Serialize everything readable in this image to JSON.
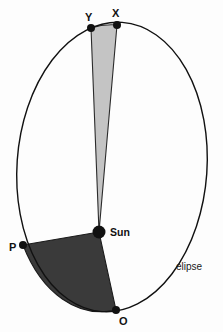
{
  "figure": {
    "background_color": "#fdfdfd",
    "stroke_color": "#111111"
  },
  "labels": {
    "point_y": "Y",
    "point_x": "X",
    "point_p": "P",
    "point_o": "O",
    "sun": "Sun",
    "ellipse": "elipse"
  },
  "chart_data": {
    "type": "diagram",
    "title": "",
    "background_color": "#fdfdfd",
    "orbit": {
      "shape": "ellipse",
      "stroke_color": "#111111",
      "stroke_width": 1.4,
      "fill": "none",
      "center": [
        112,
        167
      ],
      "semi_major_axis": 145,
      "semi_minor_axis": 95,
      "rotation_deg": 4
    },
    "points": [
      {
        "name": "Y",
        "label": "Y",
        "x": 91,
        "y": 28,
        "marker": "filled-circle",
        "radius": 4.0,
        "color": "#111111",
        "label_dx": -6,
        "label_dy": -16
      },
      {
        "name": "X",
        "label": "X",
        "x": 117,
        "y": 25,
        "marker": "filled-circle",
        "radius": 4.0,
        "color": "#111111",
        "label_dx": -5,
        "label_dy": -17
      },
      {
        "name": "P",
        "label": "P",
        "x": 23,
        "y": 245,
        "marker": "filled-circle",
        "radius": 4.0,
        "color": "#111111",
        "label_dx": -14,
        "label_dy": -3
      },
      {
        "name": "O",
        "label": "O",
        "x": 116,
        "y": 310,
        "marker": "filled-circle",
        "radius": 4.0,
        "color": "#111111",
        "label_dx": 3,
        "label_dy": 6
      },
      {
        "name": "Sun",
        "label": "Sun",
        "x": 99,
        "y": 232,
        "marker": "filled-circle",
        "radius": 6.5,
        "color": "#111111",
        "label_dx": 11,
        "label_dy": -5
      }
    ],
    "sectors": [
      {
        "name": "aphelion-sector",
        "label": "Sun-Y-X swept area",
        "fill_color": "#c4c4c4",
        "stroke_color": "#2b2b2b",
        "vertices": [
          "Sun",
          "Y",
          "X"
        ],
        "arc_from": "Y",
        "arc_to": "X",
        "note": "thin sliver near apoapsis, equal area"
      },
      {
        "name": "perihelion-sector",
        "label": "Sun-P-O swept area",
        "fill_color": "#3a3a3a",
        "stroke_color": "#1a1a1a",
        "vertices": [
          "Sun",
          "P",
          "O"
        ],
        "arc_from": "P",
        "arc_to": "O",
        "note": "wide sector near periapsis, equal area"
      }
    ],
    "annotations": [
      {
        "name": "ellipse-label",
        "text": "elipse",
        "x": 176,
        "y": 262,
        "font_size": 10
      },
      {
        "name": "sun-label",
        "text": "Sun",
        "x": 110,
        "y": 227,
        "font_size": 10.5
      }
    ],
    "legend": {
      "visible": false
    },
    "grid": false,
    "axes": {
      "visible": false
    }
  }
}
